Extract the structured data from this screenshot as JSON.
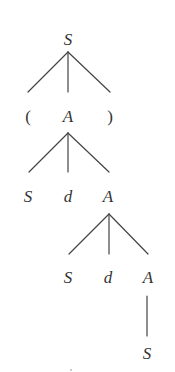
{
  "diagram": {
    "type": "parse-tree",
    "top_cut_text": "",
    "style": {
      "line_color": "#444444",
      "text_color": "#333333",
      "background": "#ffffff"
    },
    "nodes": [
      {
        "id": "n0",
        "label": "S",
        "x": 68,
        "y": 39,
        "kind": "nonterminal"
      },
      {
        "id": "n1",
        "label": "(",
        "x": 28,
        "y": 116,
        "kind": "terminal"
      },
      {
        "id": "n2",
        "label": "A",
        "x": 68,
        "y": 116,
        "kind": "nonterminal"
      },
      {
        "id": "n3",
        "label": ")",
        "x": 110,
        "y": 116,
        "kind": "terminal"
      },
      {
        "id": "n4",
        "label": "S",
        "x": 28,
        "y": 196,
        "kind": "nonterminal"
      },
      {
        "id": "n5",
        "label": "d",
        "x": 68,
        "y": 196,
        "kind": "terminal"
      },
      {
        "id": "n6",
        "label": "A",
        "x": 108,
        "y": 196,
        "kind": "nonterminal"
      },
      {
        "id": "n7",
        "label": "S",
        "x": 68,
        "y": 277,
        "kind": "nonterminal"
      },
      {
        "id": "n8",
        "label": "d",
        "x": 108,
        "y": 277,
        "kind": "terminal"
      },
      {
        "id": "n9",
        "label": "A",
        "x": 148,
        "y": 277,
        "kind": "nonterminal"
      },
      {
        "id": "n10",
        "label": "S",
        "x": 147,
        "y": 353,
        "kind": "nonterminal"
      }
    ],
    "edges": [
      {
        "from": "n0",
        "to": "n1",
        "x1": 68,
        "y1": 52,
        "x2": 28,
        "y2": 92
      },
      {
        "from": "n0",
        "to": "n2",
        "x1": 68,
        "y1": 52,
        "x2": 68,
        "y2": 92
      },
      {
        "from": "n0",
        "to": "n3",
        "x1": 68,
        "y1": 52,
        "x2": 110,
        "y2": 92
      },
      {
        "from": "n2",
        "to": "n4",
        "x1": 68,
        "y1": 133,
        "x2": 29,
        "y2": 172
      },
      {
        "from": "n2",
        "to": "n5",
        "x1": 68,
        "y1": 133,
        "x2": 68,
        "y2": 172
      },
      {
        "from": "n2",
        "to": "n6",
        "x1": 68,
        "y1": 133,
        "x2": 109,
        "y2": 172
      },
      {
        "from": "n6",
        "to": "n7",
        "x1": 109,
        "y1": 214,
        "x2": 69,
        "y2": 254
      },
      {
        "from": "n6",
        "to": "n8",
        "x1": 109,
        "y1": 214,
        "x2": 109,
        "y2": 254
      },
      {
        "from": "n6",
        "to": "n9",
        "x1": 109,
        "y1": 214,
        "x2": 148,
        "y2": 254
      },
      {
        "from": "n9",
        "to": "n10",
        "x1": 147,
        "y1": 296,
        "x2": 147,
        "y2": 336
      }
    ]
  }
}
